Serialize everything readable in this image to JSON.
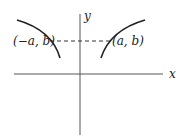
{
  "diagram": {
    "axes": {
      "x_label": "x",
      "y_label": "y"
    },
    "points": [
      {
        "label": "(−a, b)"
      },
      {
        "label": "(a, b)"
      }
    ],
    "colors": {
      "stroke": "#222222",
      "axis": "#555555",
      "background": "#ffffff"
    }
  }
}
